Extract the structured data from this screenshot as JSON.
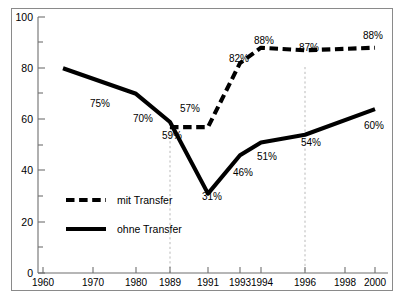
{
  "chart_data": {
    "type": "line",
    "title": "",
    "subtitle": "",
    "xlabel": "",
    "ylabel": "",
    "ylim": [
      0,
      100
    ],
    "y_ticks_major": [
      0,
      20,
      40,
      60,
      80,
      100
    ],
    "y_ticks_minor": [
      10,
      30,
      50,
      70,
      90
    ],
    "grid": false,
    "gridlines_vertical": [
      "1989",
      "1996"
    ],
    "legend_position": "inside-left",
    "x_axis_note": "non-linear year axis",
    "x": [
      "1960",
      "1970",
      "1980",
      "1989",
      "1991",
      "1993",
      "1994",
      "1996",
      "1998",
      "2000"
    ],
    "series": [
      {
        "name": "mit Transfer",
        "style": "dashed",
        "x": [
          "1989",
          "1991",
          "1993",
          "1994",
          "1996",
          "2000"
        ],
        "values": [
          57,
          57,
          82,
          88,
          87,
          88
        ],
        "labels": [
          "57%",
          null,
          "82%",
          "88%",
          "87%",
          "88%"
        ]
      },
      {
        "name": "ohne Transfer",
        "style": "solid",
        "x": [
          "1964",
          "1980",
          "1989",
          "1991",
          "1993",
          "1994",
          "1996",
          "2000"
        ],
        "values": [
          80,
          70,
          59,
          31,
          46,
          51,
          54,
          64
        ],
        "labels": [
          "75%",
          "70%",
          "59%",
          "31%",
          "46%",
          "51%",
          "54%",
          "60%"
        ]
      }
    ],
    "point_labels": [
      {
        "text": "75%",
        "x": 100,
        "y": 107
      },
      {
        "text": "70%",
        "x": 143,
        "y": 122
      },
      {
        "text": "59%",
        "x": 172,
        "y": 139
      },
      {
        "text": "57%",
        "x": 190,
        "y": 112
      },
      {
        "text": "31%",
        "x": 212,
        "y": 200
      },
      {
        "text": "82%",
        "x": 239,
        "y": 62
      },
      {
        "text": "46%",
        "x": 243,
        "y": 176
      },
      {
        "text": "88%",
        "x": 264,
        "y": 44
      },
      {
        "text": "51%",
        "x": 267,
        "y": 160
      },
      {
        "text": "87%",
        "x": 309,
        "y": 51
      },
      {
        "text": "54%",
        "x": 311,
        "y": 146
      },
      {
        "text": "88%",
        "x": 373,
        "y": 39
      },
      {
        "text": "60%",
        "x": 374,
        "y": 129
      }
    ]
  },
  "axes": {
    "y_labels": [
      "100",
      "80",
      "60",
      "40",
      "20",
      "0"
    ],
    "x_labels": [
      "1960",
      "1970",
      "1980",
      "1989",
      "1991",
      "1993",
      "1994",
      "1996",
      "1998",
      "2000"
    ]
  },
  "legend": {
    "items": [
      {
        "label": "mit Transfer",
        "style": "dashed"
      },
      {
        "label": "ohne Transfer",
        "style": "solid"
      }
    ]
  },
  "colors": {
    "series": "#000000",
    "axis": "#6f6f6f",
    "grid": "#b9b9b9",
    "frame": "#8a8a8a",
    "background": "#ffffff"
  }
}
